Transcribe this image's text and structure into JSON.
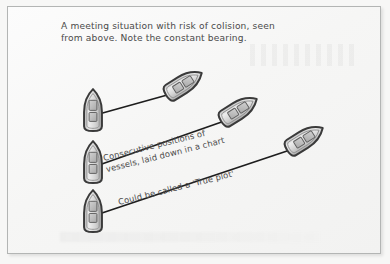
{
  "figure": {
    "kind": "nautical-collision-diagram",
    "caption": "A meeting situation with risk of colision, seen\nfrom above. Note the constant bearing.",
    "colors": {
      "paper": "#f7f7f6",
      "frame_line": "#b3b5b4",
      "ink": "#4a4a4a",
      "arrow": "#1d1d1d",
      "hull_outline": "#3a3a3a",
      "hull_fill": "#d8d8d8",
      "cabin_fill": "#bdbdbd"
    },
    "annotations": [
      {
        "id": "note-consecutive-positions",
        "lines": [
          "Consecutive positions of",
          "vessels, laid down in a chart"
        ],
        "rotation_deg": -14
      },
      {
        "id": "note-true-plot",
        "lines": [
          "Could be called a 'True plot'"
        ],
        "rotation_deg": -14
      }
    ],
    "vessels": [
      {
        "id": "own-ship-1",
        "label": "own ship position 1",
        "x": 93,
        "y": 110,
        "heading_deg": 0
      },
      {
        "id": "own-ship-2",
        "label": "own ship position 2",
        "x": 93,
        "y": 162,
        "heading_deg": 0
      },
      {
        "id": "own-ship-3",
        "label": "own ship position 3",
        "x": 93,
        "y": 211,
        "heading_deg": 0
      },
      {
        "id": "target-ship-1",
        "label": "target ship position 1",
        "x": 184,
        "y": 84,
        "heading_deg": 58
      },
      {
        "id": "target-ship-2",
        "label": "target ship position 2",
        "x": 239,
        "y": 110,
        "heading_deg": 58
      },
      {
        "id": "target-ship-3",
        "label": "target ship position 3",
        "x": 305,
        "y": 139,
        "heading_deg": 58
      }
    ],
    "bearing_lines": [
      {
        "id": "bearing-line-1",
        "from": "own-ship-1",
        "to": "target-ship-1",
        "x1": 99,
        "y1": 114,
        "x2": 178,
        "y2": 92
      },
      {
        "id": "bearing-line-2",
        "from": "own-ship-2",
        "to": "target-ship-2",
        "x1": 99,
        "y1": 165,
        "x2": 233,
        "y2": 118
      },
      {
        "id": "bearing-line-3",
        "from": "own-ship-3",
        "to": "target-ship-3",
        "x1": 99,
        "y1": 214,
        "x2": 299,
        "y2": 147
      }
    ]
  }
}
